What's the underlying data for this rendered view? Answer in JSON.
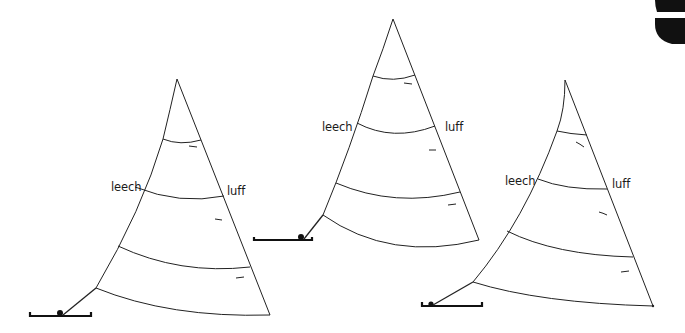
{
  "diagram": {
    "sails": [
      {
        "id": "sail-1",
        "leech_label": "leech",
        "luff_label": "luff"
      },
      {
        "id": "sail-2",
        "leech_label": "leech",
        "luff_label": "luff"
      },
      {
        "id": "sail-3",
        "leech_label": "leech",
        "luff_label": "luff"
      }
    ],
    "colors": {
      "line": "#222222",
      "background": "#ffffff",
      "corner_shape": "#111111"
    }
  }
}
